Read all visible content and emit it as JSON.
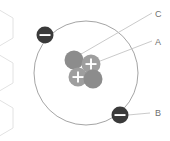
{
  "diagram": {
    "background": "#ffffff",
    "colors": {
      "orbit_stroke": "#9a9a9a",
      "neutron_fill": "#8c8c8c",
      "proton_fill": "#9e9e9e",
      "electron_fill": "#3a3a3a",
      "sign_color": "#ffffff",
      "leader_line": "#c4c4c4",
      "label_text": "#6f6f6f",
      "hexagon_stroke": "#e2e2e2"
    },
    "orbit": {
      "cx": 86,
      "cy": 73,
      "r": 52,
      "stroke_width": 0.9
    },
    "nucleus": {
      "particles": [
        {
          "id": "neutron-top-left",
          "type": "neutron",
          "symbol": "",
          "cx": 74,
          "cy": 60,
          "r": 9.5
        },
        {
          "id": "proton-top-right",
          "type": "proton",
          "symbol": "+",
          "cx": 91,
          "cy": 64,
          "r": 9.5
        },
        {
          "id": "proton-bottom-left",
          "type": "proton",
          "symbol": "+",
          "cx": 78,
          "cy": 77,
          "r": 9.5
        },
        {
          "id": "neutron-bottom-right",
          "type": "neutron",
          "symbol": "",
          "cx": 93,
          "cy": 79,
          "r": 9.5
        }
      ]
    },
    "electrons": [
      {
        "id": "electron-upper-left",
        "symbol": "−",
        "cx": 45,
        "cy": 35,
        "r": 8.5
      },
      {
        "id": "electron-lower-right",
        "symbol": "−",
        "cx": 120,
        "cy": 115,
        "r": 8.5
      }
    ],
    "labels": [
      {
        "id": "label-c",
        "text": "C",
        "x": 155,
        "y": 17,
        "leader": {
          "x1": 152,
          "y1": 13,
          "x2": 76,
          "y2": 57
        }
      },
      {
        "id": "label-a",
        "text": "A",
        "x": 155,
        "y": 45,
        "leader": {
          "x1": 152,
          "y1": 41,
          "x2": 95,
          "y2": 63
        }
      },
      {
        "id": "label-b",
        "text": "B",
        "x": 155,
        "y": 116,
        "leader": {
          "x1": 150,
          "y1": 113,
          "x2": 128,
          "y2": 115
        }
      }
    ],
    "hexagons": [
      {
        "id": "hex-top",
        "cx": -4,
        "cy": 28,
        "r": 20
      },
      {
        "id": "hex-middle",
        "cx": -4,
        "cy": 73,
        "r": 20
      },
      {
        "id": "hex-bottom",
        "cx": -4,
        "cy": 118,
        "r": 20
      }
    ]
  }
}
